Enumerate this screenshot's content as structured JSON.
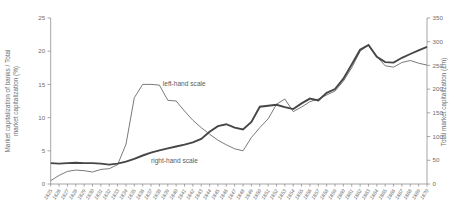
{
  "figure": {
    "background_color": "#ffffff",
    "axis_line_color": "#8f8f8f",
    "text_color": "#6e6e6e",
    "thin_line_color": "#6b6b6b",
    "thick_line_color": "#464646"
  },
  "chart_data": {
    "type": "line",
    "title": "",
    "x": [
      1825,
      1826,
      1827,
      1828,
      1829,
      1830,
      1831,
      1832,
      1833,
      1834,
      1835,
      1836,
      1837,
      1838,
      1839,
      1840,
      1841,
      1842,
      1843,
      1844,
      1845,
      1846,
      1847,
      1848,
      1849,
      1850,
      1851,
      1852,
      1853,
      1854,
      1855,
      1856,
      1857,
      1858,
      1859,
      1860,
      1861,
      1862,
      1863,
      1864,
      1865,
      1866,
      1867,
      1868,
      1869,
      1870
    ],
    "series": [
      {
        "name": "Market capitalization of banks / Total market capitalization (%)",
        "axis": "left",
        "style": "thin",
        "annotation": "left-hand scale",
        "values": [
          0.5,
          1.3,
          1.9,
          2.1,
          2.0,
          1.8,
          2.2,
          2.3,
          2.9,
          6.0,
          13.0,
          15.0,
          15.0,
          14.9,
          12.6,
          12.5,
          11.0,
          9.6,
          8.5,
          7.5,
          6.6,
          5.9,
          5.3,
          5.0,
          7.0,
          8.5,
          9.8,
          12.0,
          12.8,
          10.9,
          11.6,
          12.4,
          12.8,
          13.4,
          14.0,
          15.5,
          17.5,
          20.0,
          20.9,
          19.2,
          17.8,
          17.6,
          18.3,
          18.6,
          18.2,
          17.9
        ]
      },
      {
        "name": "Total market capitalization (£m)",
        "axis": "right",
        "style": "thick",
        "annotation": "right-hand scale",
        "values": [
          44,
          43,
          44,
          45,
          44,
          44,
          43,
          41,
          43,
          47,
          53,
          60,
          66,
          71,
          75,
          79,
          83,
          88,
          95,
          110,
          122,
          126,
          119,
          115,
          131,
          163,
          165,
          167,
          162,
          158,
          170,
          180,
          176,
          192,
          200,
          222,
          252,
          283,
          293,
          268,
          257,
          256,
          266,
          274,
          282,
          289
        ]
      }
    ],
    "left_axis": {
      "title_line1": "Market capitalization of banks / Total",
      "title_line2": "market capitalization (%)",
      "ticks": [
        0,
        5,
        10,
        15,
        20,
        25
      ],
      "range": [
        0,
        25
      ]
    },
    "right_axis": {
      "label": "Total market capitalization (£m)",
      "ticks": [
        0,
        50,
        100,
        150,
        200,
        250,
        300,
        350
      ],
      "range": [
        0,
        350
      ]
    },
    "x_axis": {
      "tick_labels": [
        "1825",
        "1826",
        "1827",
        "1828",
        "1829",
        "1830",
        "1831",
        "1832",
        "1833",
        "1834",
        "1835",
        "1836",
        "1837",
        "1838",
        "1839",
        "1840",
        "1841",
        "1842",
        "1843",
        "1844",
        "1845",
        "1846",
        "1847",
        "1848",
        "1849",
        "1850",
        "1851",
        "1852",
        "1853",
        "1854",
        "1855",
        "1856",
        "1857",
        "1858",
        "1859",
        "1860",
        "1861",
        "1862",
        "1863",
        "1864",
        "1865",
        "1866",
        "1867",
        "1868",
        "1869",
        "1870"
      ]
    },
    "annotations": [
      {
        "text": "left-hand scale",
        "year": 1838.4,
        "left_value": 14.8,
        "anchor": "start"
      },
      {
        "text": "right-hand scale",
        "year": 1837.0,
        "left_value": 3.1,
        "anchor": "start"
      }
    ],
    "grid": false,
    "legend_position": "none"
  }
}
